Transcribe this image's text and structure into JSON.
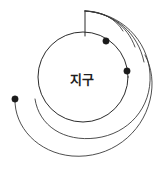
{
  "figure": {
    "background_color": "#ffffff",
    "ink_color": "#2b2b2b",
    "width": 165,
    "height": 171
  },
  "earth": {
    "label": "지구",
    "label_x": 70,
    "label_y": 84,
    "center_x": 83,
    "center_y": 77,
    "radius": 45,
    "stroke_color": "#2b2b2b"
  },
  "launch_tower": {
    "name": "launch-tower",
    "top_x": 85,
    "top_y": 11,
    "base_x": 85,
    "base_y": 36,
    "stroke_color": "#2b2b2b"
  },
  "trajectories": [
    {
      "name": "trajectory-short",
      "path": "M 85 11 C 102 11 116 19 123 31",
      "stroke_color": "#2b2b2b"
    },
    {
      "name": "trajectory-medium",
      "path": "M 85 11 C 108 12 127 25 135 47",
      "stroke_color": "#2b2b2b"
    },
    {
      "name": "trajectory-long",
      "path": "M 85 11 C 115 13 138 33 144 62",
      "stroke_color": "#2b2b2b"
    },
    {
      "name": "trajectory-orbit-closed",
      "path": "M 85 11 C 121 13 148 40 150 74 C 152 108 128 134 96 138 C 64 142 39 126 35 99",
      "stroke_color": "#2b2b2b"
    },
    {
      "name": "trajectory-escape-spiral",
      "path": "M 15 99 C 14 127 38 153 72 156 C 110 159 142 134 150 100 C 154 84 152 68 145 55",
      "stroke_color": "#2b2b2b"
    }
  ],
  "markers": [
    {
      "name": "impact-point-upper",
      "x": 106,
      "y": 41,
      "r": 3.2
    },
    {
      "name": "impact-point-lower",
      "x": 127,
      "y": 71,
      "r": 3.2
    },
    {
      "name": "orbit-start-point-left",
      "x": 15,
      "y": 99,
      "r": 3.2
    }
  ]
}
